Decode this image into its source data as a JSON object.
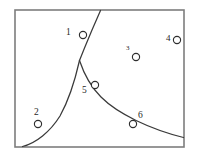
{
  "figure": {
    "background_color": "#ffffff",
    "frame": {
      "name": "plot-border",
      "x": 15,
      "y": 10,
      "width": 169,
      "height": 137,
      "stroke_color": "#7d7d7d",
      "stroke_width": 1.6
    },
    "curve_color": "#3a3a3a",
    "marker_stroke_color": "#2e2e2e",
    "marker_fill_color": "#ffffff",
    "marker_radius": 3.6,
    "label_color": "#1f1f1f"
  },
  "chart_data": {
    "type": "scatter",
    "title": "",
    "subtitle": "",
    "xlabel": "",
    "ylabel": "",
    "xlim": [
      15,
      184
    ],
    "ylim": [
      147,
      10
    ],
    "grid": false,
    "legend": null,
    "annotations": [],
    "axis_ticks": {
      "x": [],
      "y": []
    },
    "points": [
      {
        "label": "1",
        "x": 83,
        "y": 35,
        "label_x": 66,
        "label_y": 28,
        "label_size": 9.5
      },
      {
        "label": "2",
        "x": 38,
        "y": 124,
        "label_x": 34,
        "label_y": 108,
        "label_size": 9.5
      },
      {
        "label": "3",
        "x": 136,
        "y": 57,
        "label_x": 126,
        "label_y": 45,
        "label_size": 7.0
      },
      {
        "label": "4",
        "x": 177,
        "y": 40,
        "label_x": 166,
        "label_y": 34,
        "label_size": 9.0
      },
      {
        "label": "5",
        "x": 95,
        "y": 85,
        "label_x": 82,
        "label_y": 86,
        "label_size": 9.5
      },
      {
        "label": "6",
        "x": 133,
        "y": 124,
        "label_x": 138,
        "label_y": 111,
        "label_size": 9.5
      }
    ],
    "series": [
      {
        "name": "upper-branch",
        "description": "near-straight rising segment from cusp to top border",
        "path": "M 100.5 10.5 L 92 30 L 84.5 48 L 79.5 60.5"
      },
      {
        "name": "lower-left-branch",
        "description": "asymptotic rising curve from bottom-left to cusp",
        "path": "M 79.5 60.5 C 76 76 70 98 60 116 C 50 132 36 143 22.5 146.5"
      },
      {
        "name": "lower-right-branch",
        "description": "hyperbolic decaying curve from cusp to right border",
        "path": "M 79.5 60.5 C 84 74 90 86 101 97 C 118 114 150 129 183.5 137.5"
      }
    ]
  }
}
